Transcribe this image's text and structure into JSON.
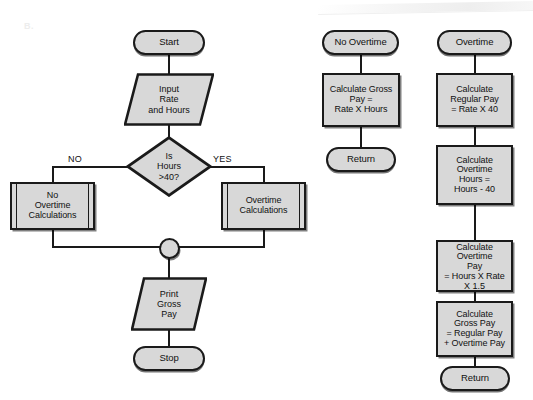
{
  "figure": {
    "label": "B.",
    "colors": {
      "node_fill": "#d8d8d8",
      "stroke": "#1a1a1a",
      "background": "#ffffff",
      "label_gray": "#ededed"
    }
  },
  "main_flow": {
    "start": "Start",
    "input": "Input\nRate\nand Hours",
    "decision": "Is\nHours\n>40?",
    "branch_no": "NO",
    "branch_yes": "YES",
    "no_overtime_calculations": "No\nOvertime\nCalculations",
    "overtime_calculations": "Overtime\nCalculations",
    "connector": "",
    "print": "Print\nGross\nPay",
    "stop": "Stop"
  },
  "no_overtime_subroutine": {
    "entry": "No Overtime",
    "calc_gross": "Calculate Gross\nPay =\nRate X Hours",
    "exit": "Return"
  },
  "overtime_subroutine": {
    "entry": "Overtime",
    "calc_regular": "Calculate\nRegular Pay\n= Rate  X  40",
    "calc_ot_hours": "Calculate\nOvertime\nHours  =\nHours - 40",
    "calc_ot_pay": "Calculate\nOvertime\nPay\n= Hours X Rate",
    "calc_ot_pay_overflow": "X 1.5",
    "calc_gross": "Calculate\nGross Pay\n= Regular Pay\n+ Overtime Pay",
    "exit": "Return"
  }
}
